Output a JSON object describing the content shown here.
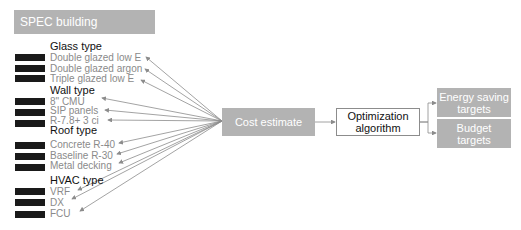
{
  "title": "SPEC building components",
  "groups": [
    {
      "label": "Glass type",
      "items": [
        "Double glazed low E",
        "Double glazed argon",
        "Triple glazed low E"
      ]
    },
    {
      "label": "Wall type",
      "items": [
        "8\" CMU",
        "SIP panels",
        "R-7.8+ 3 ci"
      ]
    },
    {
      "label": "Roof type",
      "items": [
        "Concrete R-40",
        "Baseline R-30",
        "Metal decking"
      ]
    },
    {
      "label": "HVAC type",
      "items": [
        "VRF",
        "DX",
        "FCU"
      ]
    }
  ],
  "flow": {
    "cost_estimate": "Cost estimate",
    "optimization": {
      "line1": "Optimization",
      "line2": "algorithm"
    },
    "energy_targets": {
      "line1": "Energy saving",
      "line2": "targets"
    },
    "budget_targets": {
      "line1": "Budget",
      "line2": "targets"
    }
  },
  "colors": {
    "box_gray": "#b3b3b3",
    "arrow": "#8c8c8c",
    "bar": "#1a1a1a",
    "item_text": "#8a8a8a"
  }
}
